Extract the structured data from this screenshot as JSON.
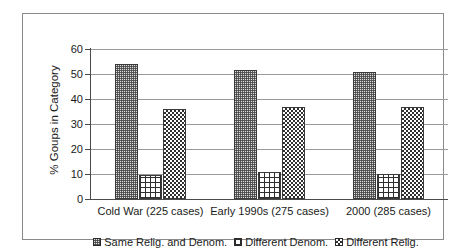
{
  "chart_data": {
    "type": "bar",
    "title": "",
    "subtitle": "",
    "xlabel": "",
    "ylabel": "% Goups in Category",
    "ylim": [
      0,
      60
    ],
    "yticks": [
      0,
      10,
      20,
      30,
      40,
      50,
      60
    ],
    "ytick_labels": [
      "0",
      "10",
      "20",
      "30",
      "40",
      "50",
      "60"
    ],
    "grid": true,
    "legend_position": "bottom",
    "categories": [
      "Cold War (225 cases)",
      "Early 1990s (275 cases)",
      "2000 (285 cases)"
    ],
    "series": [
      {
        "name": "Same Relig. and Denom.",
        "pattern": "stipple",
        "values": [
          54,
          51.5,
          51
        ]
      },
      {
        "name": "Different Denom.",
        "pattern": "grid",
        "values": [
          9.5,
          11,
          10
        ]
      },
      {
        "name": "Different Relig.",
        "pattern": "check",
        "values": [
          36,
          37,
          37
        ]
      }
    ]
  },
  "legend": {
    "entries": [
      {
        "label": "Same Relig. and Denom."
      },
      {
        "label": "Different Denom."
      },
      {
        "label": "Different Relig."
      }
    ]
  },
  "colors": {
    "frame": "#8a8a8a",
    "gridline": "#9a9a9a",
    "axis": "#4a4a4a",
    "text": "#1a1a1a",
    "bar_outline": "#3a3a3a"
  }
}
